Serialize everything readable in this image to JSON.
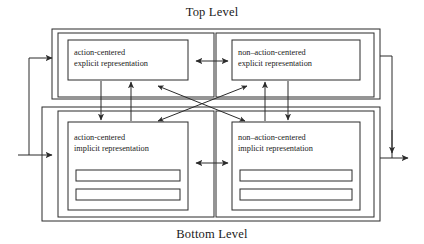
{
  "figure": {
    "top_caption": "Top Level",
    "bottom_caption": "Bottom Level",
    "line_color": "#2b2b2b",
    "background_color": "#ffffff",
    "text_color": "#1a1a1a"
  },
  "modules": {
    "top_left": {
      "line1": "action-centered",
      "line2": "explicit representation"
    },
    "top_right": {
      "line1": "non–action-centered",
      "line2": "explicit representation"
    },
    "bottom_left": {
      "line1": "action-centered",
      "line2": "implicit representation"
    },
    "bottom_right": {
      "line1": "non–action-centered",
      "line2": "implicit representation"
    }
  },
  "connections": {
    "top_horizontal": "bidirectional link between action-centered and non-action-centered explicit representation",
    "bottom_horizontal": "bidirectional link between action-centered and non-action-centered implicit representation",
    "left_vertical_down": "top-down link action-centered explicit to implicit",
    "left_vertical_up": "bottom-up link action-centered implicit to explicit",
    "right_vertical_up": "bottom-up link non-action-centered implicit to explicit",
    "right_vertical_down": "top-down link non-action-centered explicit to implicit",
    "diagonal_a": "bidirectional crossing link top-left to bottom-right",
    "diagonal_b": "bidirectional crossing link top-right to bottom-left",
    "input_top": "external input to top level",
    "input_bottom": "external input to bottom level",
    "output_right": "external output from both levels"
  }
}
